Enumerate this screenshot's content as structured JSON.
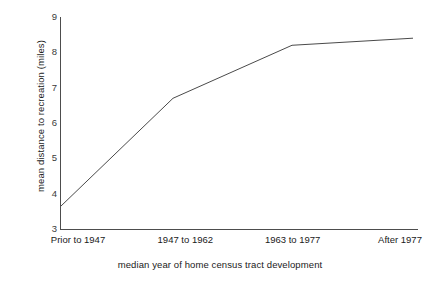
{
  "chart_data": {
    "type": "line",
    "title": "",
    "subtitle": "",
    "xlabel": "median year of home census tract development",
    "ylabel": "mean distance to recreation (miles)",
    "categories": [
      "Prior to 1947",
      "1947 to 1962",
      "1963 to 1977",
      "After 1977"
    ],
    "values": [
      3.65,
      6.7,
      8.2,
      8.4
    ],
    "series": [
      {
        "name": "mean distance to recreation",
        "values": [
          3.65,
          6.7,
          8.2,
          8.4
        ]
      }
    ],
    "ylim": [
      3,
      9
    ],
    "ytick_labels": [
      "9",
      "8",
      "7",
      "6",
      "5",
      "4",
      "3"
    ],
    "ytick_values": [
      9,
      8,
      7,
      6,
      5,
      4,
      3
    ],
    "xtick_labels": [
      "Prior to 1947",
      "1947 to 1962",
      "1963 to 1977",
      "After 1977"
    ],
    "grid": false,
    "legend": false,
    "legend_position": "none",
    "annotations": [],
    "line_color": "#4a4a4a",
    "axis_color": "#4d4d4d",
    "background_color": "#ffffff"
  },
  "axes": {
    "y_title": "mean distance to recreation (miles)",
    "x_title": "median year of home census tract development"
  }
}
